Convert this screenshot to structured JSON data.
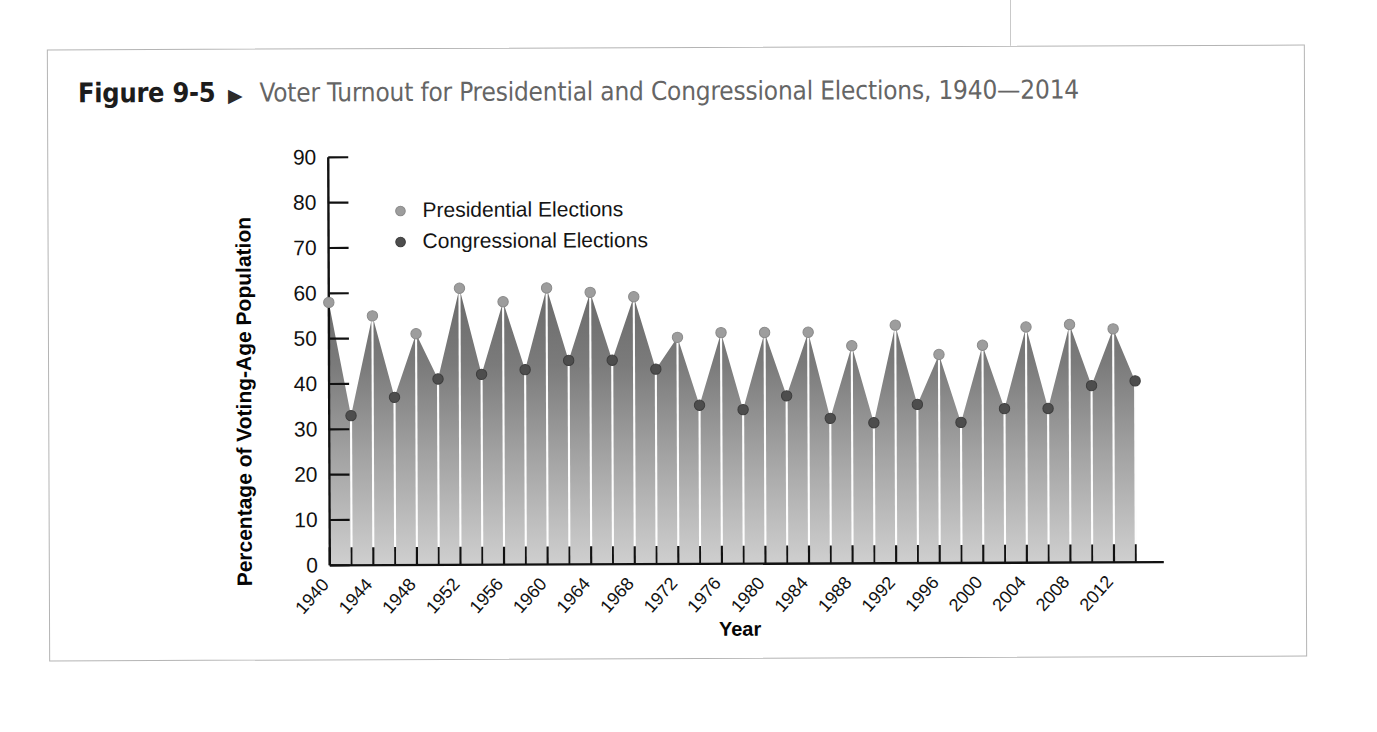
{
  "figure": {
    "number": "Figure 9-5",
    "arrow_icon": "triangle-right-icon",
    "title": "Voter Turnout for Presidential and Congressional Elections, 1940—2014"
  },
  "colors": {
    "presidential_marker": "#9d9d9d",
    "congressional_marker": "#4d4d4d",
    "fill_top": "#6e6e6e",
    "fill_bottom": "#cfcfcf",
    "axis": "#111111",
    "figure_number": "#1c1c1c",
    "figure_title": "#656565",
    "border": "#b4b4b4"
  },
  "chart_data": {
    "type": "area",
    "title": "Voter Turnout for Presidential and Congressional Elections, 1940—2014",
    "xlabel": "Year",
    "ylabel": "Percentage of Voting-Age Population",
    "ylim": [
      0,
      90
    ],
    "xlim": [
      1940,
      2014
    ],
    "ytick_labels": [
      "0",
      "10",
      "20",
      "30",
      "40",
      "50",
      "60",
      "70",
      "80",
      "90"
    ],
    "ytick_values": [
      0,
      10,
      20,
      30,
      40,
      50,
      60,
      70,
      80,
      90
    ],
    "xtick_labels": [
      "1940",
      "1944",
      "1948",
      "1952",
      "1956",
      "1960",
      "1964",
      "1968",
      "1972",
      "1976",
      "1980",
      "1984",
      "1988",
      "1992",
      "1996",
      "2000",
      "2004",
      "2008",
      "2012"
    ],
    "xtick_values": [
      1940,
      1944,
      1948,
      1952,
      1956,
      1960,
      1964,
      1968,
      1972,
      1976,
      1980,
      1984,
      1988,
      1992,
      1996,
      2000,
      2004,
      2008,
      2012
    ],
    "xtick_minor_step": 2,
    "grid": false,
    "legend_position": "upper-left-inside",
    "x": [
      1940,
      1942,
      1944,
      1946,
      1948,
      1950,
      1952,
      1954,
      1956,
      1958,
      1960,
      1962,
      1964,
      1966,
      1968,
      1970,
      1972,
      1974,
      1976,
      1978,
      1980,
      1982,
      1984,
      1986,
      1988,
      1990,
      1992,
      1994,
      1996,
      1998,
      2000,
      2002,
      2004,
      2006,
      2008,
      2010,
      2012,
      2014
    ],
    "values": [
      58,
      33,
      55,
      37,
      51,
      41,
      61,
      42,
      58,
      43,
      61,
      45,
      60,
      45,
      59,
      43,
      50,
      35,
      51,
      34,
      51,
      37,
      51,
      32,
      48,
      31,
      52.5,
      35,
      46,
      31,
      48,
      34,
      52,
      34,
      52.5,
      39,
      51.5,
      40
    ],
    "series": [
      {
        "name": "Presidential Elections",
        "marker": "light-gray-dot",
        "points": [
          {
            "year": 1940,
            "value": 58
          },
          {
            "year": 1944,
            "value": 55
          },
          {
            "year": 1948,
            "value": 51
          },
          {
            "year": 1952,
            "value": 61
          },
          {
            "year": 1956,
            "value": 58
          },
          {
            "year": 1960,
            "value": 61
          },
          {
            "year": 1964,
            "value": 60
          },
          {
            "year": 1968,
            "value": 59
          },
          {
            "year": 1972,
            "value": 50
          },
          {
            "year": 1976,
            "value": 51
          },
          {
            "year": 1980,
            "value": 51
          },
          {
            "year": 1984,
            "value": 51
          },
          {
            "year": 1988,
            "value": 48
          },
          {
            "year": 1992,
            "value": 52.5
          },
          {
            "year": 1996,
            "value": 46
          },
          {
            "year": 2000,
            "value": 48
          },
          {
            "year": 2004,
            "value": 52
          },
          {
            "year": 2008,
            "value": 52.5
          },
          {
            "year": 2012,
            "value": 51.5
          }
        ]
      },
      {
        "name": "Congressional Elections",
        "marker": "dark-gray-dot",
        "points": [
          {
            "year": 1942,
            "value": 33
          },
          {
            "year": 1946,
            "value": 37
          },
          {
            "year": 1950,
            "value": 41
          },
          {
            "year": 1954,
            "value": 42
          },
          {
            "year": 1958,
            "value": 43
          },
          {
            "year": 1962,
            "value": 45
          },
          {
            "year": 1966,
            "value": 45
          },
          {
            "year": 1970,
            "value": 43
          },
          {
            "year": 1974,
            "value": 35
          },
          {
            "year": 1978,
            "value": 34
          },
          {
            "year": 1982,
            "value": 37
          },
          {
            "year": 1986,
            "value": 32
          },
          {
            "year": 1990,
            "value": 31
          },
          {
            "year": 1994,
            "value": 35
          },
          {
            "year": 1998,
            "value": 31
          },
          {
            "year": 2002,
            "value": 34
          },
          {
            "year": 2006,
            "value": 34
          },
          {
            "year": 2010,
            "value": 39
          },
          {
            "year": 2014,
            "value": 40
          }
        ]
      }
    ]
  },
  "legend": {
    "items": [
      {
        "label": "Presidential Elections",
        "marker": "light-gray-dot"
      },
      {
        "label": "Congressional Elections",
        "marker": "dark-gray-dot"
      }
    ]
  }
}
